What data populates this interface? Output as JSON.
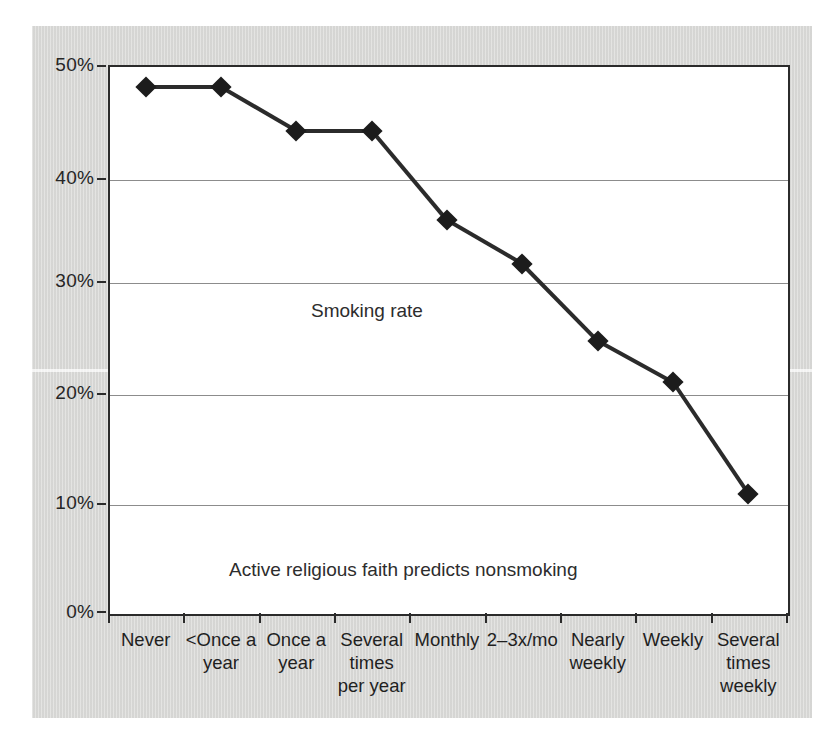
{
  "chart_data": {
    "type": "line",
    "title": "",
    "subtitle": "",
    "xlabel": "",
    "ylabel": "",
    "categories": [
      "Never",
      "<Once a\nyear",
      "Once a\nyear",
      "Several\ntimes\nper year",
      "Monthly",
      "2–3x/mo",
      "Nearly\nweekly",
      "Weekly",
      "Several\ntimes\nweekly"
    ],
    "series": [
      {
        "name": "Smoking rate",
        "values": [
          48,
          48,
          44,
          44,
          35.8,
          31.8,
          24.8,
          21,
          10.8
        ]
      }
    ],
    "ylim": [
      0,
      50
    ],
    "yticks": [
      0,
      10,
      20,
      30,
      40,
      50
    ],
    "ytick_labels": [
      "0%",
      "10%",
      "20%",
      "30%",
      "40%",
      "50%"
    ],
    "grid": "horizontal",
    "legend": "none",
    "annotations": [
      {
        "id": "series-label",
        "text": "Smoking rate"
      },
      {
        "id": "caption",
        "text": "Active religious faith predicts nonsmoking"
      }
    ],
    "colors": {
      "line": "#2b2b2b",
      "marker": "#1c1c1c",
      "grid": "#8c8c8c",
      "axis": "#2b2b2b",
      "plot_background": "#ffffff",
      "panel_background": "#d8d8d6"
    },
    "marker_style": "diamond"
  }
}
